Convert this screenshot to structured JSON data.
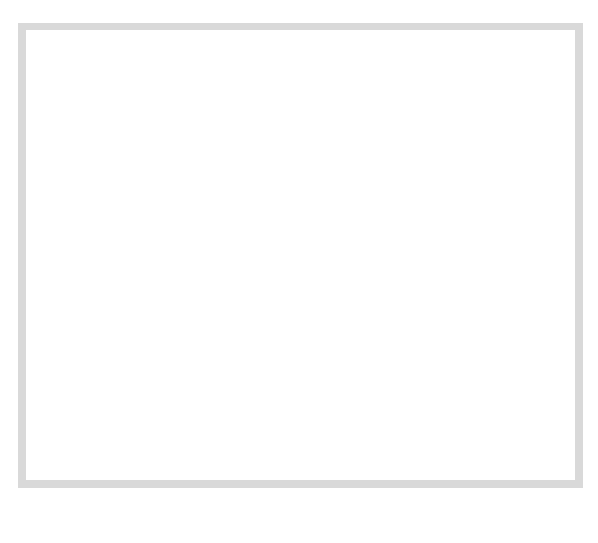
{
  "gender_label": "MALE",
  "columns": [
    {
      "key": "T_left",
      "top": "T or Tc",
      "bottom": ""
    },
    {
      "key": "L",
      "top": "L",
      "bottom": ""
    },
    {
      "key": "F",
      "top": "F",
      "bottom": ""
    },
    {
      "key": "K",
      "top": "K",
      "bottom": ""
    },
    {
      "key": "Hs",
      "top": "Hs + 5K",
      "bottom": "1"
    },
    {
      "key": "D",
      "top": "D",
      "bottom": "2"
    },
    {
      "key": "Hy",
      "top": "Hy",
      "bottom": "3"
    },
    {
      "key": "Pd",
      "top": "Pd + 4K",
      "bottom": "4"
    },
    {
      "key": "Mi",
      "top": "Mi",
      "bottom": "5"
    },
    {
      "key": "Pa",
      "top": "Pa",
      "bottom": "6"
    },
    {
      "key": "Pt",
      "top": "Pt + IK",
      "bottom": "7"
    },
    {
      "key": "Sc",
      "top": "Sc + IK",
      "bottom": "8"
    },
    {
      "key": "Ma",
      "top": "Ma + 2K",
      "bottom": "9"
    },
    {
      "key": "Si",
      "top": "Si",
      "bottom": "0"
    },
    {
      "key": "T_right",
      "top": "T or Tc",
      "bottom": ""
    }
  ],
  "chart_data": {
    "type": "line",
    "title": "",
    "xlabel": "",
    "ylabel": "T or Tc",
    "ylim": [
      30,
      120
    ],
    "y_ticks": [
      30,
      35,
      40,
      45,
      50,
      55,
      60,
      65,
      70,
      75,
      80,
      85,
      90,
      95,
      100,
      105,
      110,
      115,
      120
    ],
    "reference_lines_T": [
      50,
      65
    ],
    "annotations": [
      "MALE"
    ],
    "validity_profile": {
      "categories": [
        "L",
        "F",
        "K"
      ],
      "raw_scores": [
        10,
        5,
        20
      ],
      "t_scores": [
        78,
        50,
        60
      ]
    },
    "clinical_profile": {
      "categories": [
        "Hs + 5K",
        "D",
        "Hy",
        "Pd + 4K",
        "Mi",
        "Pa",
        "Pt + IK",
        "Sc + IK",
        "Ma + 2K",
        "Si"
      ],
      "scale_numbers": [
        "1",
        "2",
        "3",
        "4",
        "5",
        "6",
        "7",
        "8",
        "9",
        "0"
      ],
      "raw_scores": [
        15,
        25,
        25,
        40,
        30,
        10,
        28,
        30,
        30,
        25
      ],
      "t_scores": [
        55,
        62,
        65,
        94,
        57,
        50,
        56,
        57,
        98,
        48
      ]
    },
    "raw_scale_labels": {
      "L": [
        {
          "v": "15",
          "T": 100
        },
        {
          "v": "10",
          "T": 78
        },
        {
          "v": "5",
          "T": 57
        },
        {
          "v": "0",
          "T": 35
        }
      ],
      "F": [
        {
          "v": "25",
          "T": 110
        },
        {
          "v": "20",
          "T": 96
        },
        {
          "v": "15",
          "T": 81
        },
        {
          "v": "10",
          "T": 66
        },
        {
          "v": "5",
          "T": 50
        },
        {
          "v": "0",
          "T": 36
        }
      ],
      "K": [
        {
          "v": "30",
          "T": 81
        },
        {
          "v": "25",
          "T": 70
        },
        {
          "v": "20",
          "T": 60
        },
        {
          "v": "15",
          "T": 49
        },
        {
          "v": "10",
          "T": 39
        }
      ],
      "Hs": [
        {
          "v": "40",
          "T": 110
        },
        {
          "v": "35",
          "T": 99
        },
        {
          "v": "30",
          "T": 88
        },
        {
          "v": "25",
          "T": 77
        },
        {
          "v": "20",
          "T": 66
        },
        {
          "v": "15",
          "T": 55
        },
        {
          "v": "10",
          "T": 44
        },
        {
          "v": "5",
          "T": 33
        }
      ],
      "D": [
        {
          "v": "55",
          "T": 120
        },
        {
          "v": "50",
          "T": 110
        },
        {
          "v": "45",
          "T": 101
        },
        {
          "v": "40",
          "T": 91
        },
        {
          "v": "35",
          "T": 81
        },
        {
          "v": "30",
          "T": 72
        },
        {
          "v": "25",
          "T": 62
        },
        {
          "v": "20",
          "T": 52
        },
        {
          "v": "15",
          "T": 43
        },
        {
          "v": "10",
          "T": 33
        }
      ],
      "Hy": [
        {
          "v": "50",
          "T": 120
        },
        {
          "v": "45",
          "T": 109
        },
        {
          "v": "40",
          "T": 98
        },
        {
          "v": "35",
          "T": 87
        },
        {
          "v": "30",
          "T": 76
        },
        {
          "v": "25",
          "T": 65
        },
        {
          "v": "20",
          "T": 54
        },
        {
          "v": "15",
          "T": 43
        },
        {
          "v": "10",
          "T": 33
        }
      ],
      "Pd": [
        {
          "v": "50",
          "T": 117
        },
        {
          "v": "45",
          "T": 106
        },
        {
          "v": "40",
          "T": 94
        },
        {
          "v": "35",
          "T": 82
        },
        {
          "v": "30",
          "T": 70
        },
        {
          "v": "25",
          "T": 58
        },
        {
          "v": "20",
          "T": 47
        },
        {
          "v": "15",
          "T": 35
        }
      ],
      "Mi": [
        {
          "v": "55",
          "T": 107
        },
        {
          "v": "50",
          "T": 97
        },
        {
          "v": "45",
          "T": 87
        },
        {
          "v": "40",
          "T": 77
        },
        {
          "v": "35",
          "T": 67
        },
        {
          "v": "30",
          "T": 57
        },
        {
          "v": "25",
          "T": 47
        },
        {
          "v": "20",
          "T": 37
        }
      ],
      "Pa": [
        {
          "v": "30",
          "T": 120
        },
        {
          "v": "25",
          "T": 102
        },
        {
          "v": "20",
          "T": 85
        },
        {
          "v": "15",
          "T": 67
        },
        {
          "v": "10",
          "T": 50
        },
        {
          "v": "5",
          "T": 32
        }
      ],
      "Pt": [
        {
          "v": "60",
          "T": 120
        },
        {
          "v": "55",
          "T": 108
        },
        {
          "v": "50",
          "T": 96
        },
        {
          "v": "45",
          "T": 84
        },
        {
          "v": "40",
          "T": 72
        },
        {
          "v": "35",
          "T": 61
        },
        {
          "v": "30",
          "T": 49
        },
        {
          "v": "25",
          "T": 49
        },
        {
          "v": "20",
          "T": 39
        },
        {
          "v": "15",
          "T": 31
        }
      ],
      "Sc": [
        {
          "v": "65",
          "T": 116
        },
        {
          "v": "60",
          "T": 108
        },
        {
          "v": "55",
          "T": 99
        },
        {
          "v": "50",
          "T": 91
        },
        {
          "v": "45",
          "T": 82
        },
        {
          "v": "40",
          "T": 74
        },
        {
          "v": "35",
          "T": 65
        },
        {
          "v": "30",
          "T": 57
        },
        {
          "v": "25",
          "T": 49
        },
        {
          "v": "20",
          "T": 40
        },
        {
          "v": "15",
          "T": 32
        }
      ],
      "Ma": [
        {
          "v": "40",
          "T": 112
        },
        {
          "v": "35",
          "T": 101
        },
        {
          "v": "30",
          "T": 98
        },
        {
          "v": "25",
          "T": 79
        },
        {
          "v": "20",
          "T": 57
        },
        {
          "v": "15",
          "T": 46
        },
        {
          "v": "10",
          "T": 34
        }
      ],
      "Si": [
        {
          "v": "65",
          "T": 95
        },
        {
          "v": "60",
          "T": 90
        },
        {
          "v": "55",
          "T": 85
        },
        {
          "v": "50",
          "T": 79
        },
        {
          "v": "45",
          "T": 72
        },
        {
          "v": "40",
          "T": 65
        },
        {
          "v": "35",
          "T": 60
        },
        {
          "v": "30",
          "T": 55
        },
        {
          "v": "25",
          "T": 48
        },
        {
          "v": "20",
          "T": 41
        },
        {
          "v": "15",
          "T": 35
        },
        {
          "v": "10",
          "T": 30
        }
      ]
    }
  }
}
